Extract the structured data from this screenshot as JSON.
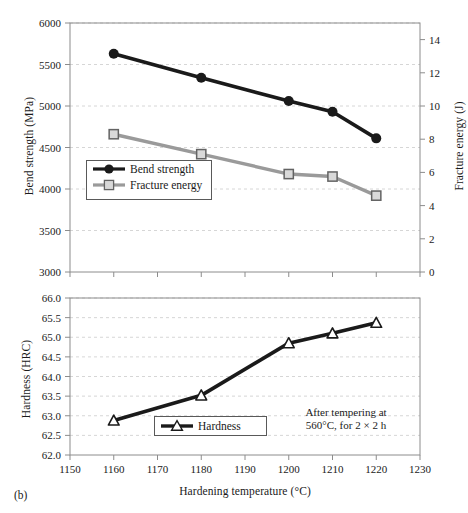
{
  "figure": {
    "panel_label": "(b)",
    "annotation_line1": "After tempering at",
    "annotation_line2": "560°C, for 2 × 2 h"
  },
  "colors": {
    "bend_strength": "#1a1a1a",
    "fracture_energy": "#9a9a9a",
    "hardness": "#1a1a1a",
    "grid": "#cccccc",
    "frame": "#8c8c8c",
    "text": "#1a1a1a"
  },
  "chart_data": [
    {
      "type": "line",
      "id": "top-panel",
      "title": "",
      "xlabel": "",
      "ylabel": "Bend strength (MPa)",
      "y2label": "Fracture energy (J)",
      "x": [
        1160,
        1180,
        1200,
        1210,
        1220
      ],
      "xlim": [
        1150,
        1230
      ],
      "xticks": [
        1150,
        1160,
        1170,
        1180,
        1190,
        1200,
        1210,
        1220,
        1230
      ],
      "xticklabels": [
        "1150",
        "1160",
        "1170",
        "1180",
        "1190",
        "1200",
        "1210",
        "1220",
        "1230"
      ],
      "ylim": [
        3000,
        6000
      ],
      "yticks": [
        3000,
        3500,
        4000,
        4500,
        5000,
        5500,
        6000
      ],
      "yticklabels": [
        "3000",
        "3500",
        "4000",
        "4500",
        "5000",
        "5500",
        "6000"
      ],
      "y2lim": [
        0,
        15
      ],
      "y2ticks": [
        0,
        2,
        4,
        6,
        8,
        10,
        12,
        14
      ],
      "y2ticklabels": [
        "0",
        "2",
        "4",
        "6",
        "8",
        "10",
        "12",
        "14"
      ],
      "grid": true,
      "legend_position": "lower-left",
      "series": [
        {
          "name": "Bend strength",
          "axis": "left",
          "marker": "filled-circle",
          "color": "#1a1a1a",
          "values": [
            5630,
            5340,
            5060,
            4930,
            4610
          ]
        },
        {
          "name": "Fracture energy",
          "axis": "right",
          "marker": "open-square",
          "color": "#9a9a9a",
          "values": [
            8.3,
            7.1,
            5.9,
            5.75,
            4.6
          ]
        }
      ]
    },
    {
      "type": "line",
      "id": "bottom-panel",
      "title": "",
      "xlabel": "Hardening temperature (°C)",
      "ylabel": "Hardness (HRC)",
      "x": [
        1160,
        1180,
        1200,
        1210,
        1220
      ],
      "xlim": [
        1150,
        1230
      ],
      "xticks": [
        1150,
        1160,
        1170,
        1180,
        1190,
        1200,
        1210,
        1220,
        1230
      ],
      "xticklabels": [
        "1150",
        "1160",
        "1170",
        "1180",
        "1190",
        "1200",
        "1210",
        "1220",
        "1230"
      ],
      "ylim": [
        62.0,
        66.0
      ],
      "yticks": [
        62.0,
        62.5,
        63.0,
        63.5,
        64.0,
        64.5,
        65.0,
        65.5,
        66.0
      ],
      "yticklabels": [
        "62.0",
        "62.5",
        "63.0",
        "63.5",
        "64.0",
        "64.5",
        "65.0",
        "65.5",
        "66.0"
      ],
      "grid": true,
      "legend_position": "lower-center",
      "series": [
        {
          "name": "Hardness",
          "axis": "left",
          "marker": "open-triangle",
          "color": "#1a1a1a",
          "values": [
            62.88,
            63.52,
            64.85,
            65.1,
            65.37
          ]
        }
      ]
    }
  ],
  "legends": {
    "top": [
      {
        "label": "Bend strength",
        "marker": "filled-circle",
        "color": "#1a1a1a"
      },
      {
        "label": "Fracture energy",
        "marker": "open-square",
        "color": "#9a9a9a"
      }
    ],
    "bottom": [
      {
        "label": "Hardness",
        "marker": "open-triangle",
        "color": "#1a1a1a"
      }
    ]
  }
}
